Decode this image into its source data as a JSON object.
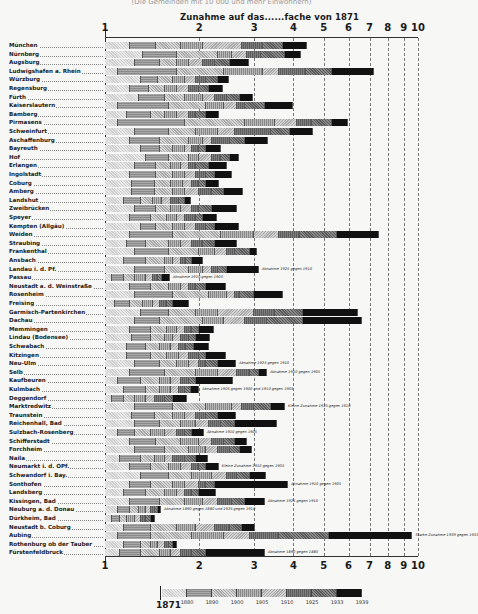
{
  "chart_data": {
    "type": "bar",
    "orientation": "horizontal",
    "stacked": true,
    "scale": "log",
    "title": "Zunahme auf das......fache von 1871",
    "xlabel": "Zunahme auf das......fache von 1871",
    "ylabel": "",
    "xlim": [
      1,
      10
    ],
    "x_ticks": [
      1,
      2,
      3,
      4,
      5,
      6,
      7,
      8,
      9,
      10
    ],
    "grid": true,
    "legend_position": "bottom",
    "legend": {
      "base_label": "1871",
      "entries": [
        "1880",
        "1890",
        "1900",
        "1905",
        "1910",
        "1925",
        "1933",
        "1939"
      ]
    },
    "categories": [
      "München",
      "Nürnberg",
      "Augsburg",
      "Ludwigshafen a. Rhein",
      "Würzburg",
      "Regensburg",
      "Fürth",
      "Kaiserslautern",
      "Bamberg",
      "Pirmasens",
      "Schweinfurt",
      "Aschaffenburg",
      "Bayreuth",
      "Hof",
      "Erlangen",
      "Ingolstadt",
      "Coburg",
      "Amberg",
      "Landshut",
      "Zweibrücken",
      "Speyer",
      "Kempten (Allgäu)",
      "Weiden",
      "Straubing",
      "Frankenthal",
      "Ansbach",
      "Landau i. d. Pf.",
      "Passau",
      "Neustadt a. d. Weinstraße",
      "Rosenheim",
      "Freising",
      "Garmisch-Partenkirchen",
      "Dachau",
      "Memmingen",
      "Lindau (Bodensee)",
      "Schwabach",
      "Kitzingen",
      "Neu-Ulm",
      "Selb",
      "Kaufbeuren",
      "Kulmbach",
      "Deggendorf",
      "Marktredwitz",
      "Traunstein",
      "Reichenhall, Bad",
      "Sulzbach-Rosenberg",
      "Schifferstadt",
      "Forchheim",
      "Naila",
      "Neumarkt i. d. OPf.",
      "Schwandorf i. Bay.",
      "Sonthofen",
      "Landsberg",
      "Kissingen, Bad",
      "Neuburg a. d. Donau",
      "Dürkheim, Bad",
      "Neustadt b. Coburg",
      "Aubing",
      "Rothenburg ob der Tauber",
      "Fürstenfeldbruck"
    ],
    "series_note": "Each bar = growth factor vs 1871 at census years 1880, 1890, 1900, 1905, 1910, 1925, 1933, 1939 (cumulative). Values estimated from pixels.",
    "values_1939": [
      4.42,
      4.23,
      2.88,
      7.25,
      2.49,
      2.38,
      2.97,
      3.99,
      2.31,
      5.97,
      4.62,
      3.32,
      2.34,
      2.68,
      2.45,
      2.55,
      2.31,
      2.76,
      1.89,
      2.64,
      2.28,
      2.68,
      7.49,
      2.64,
      3.06,
      2.05,
      3.1,
      1.61,
      2.43,
      3.7,
      1.86,
      6.43,
      6.63,
      2.23,
      2.17,
      2.15,
      2.43,
      2.62,
      3.29,
      2.56,
      2.0,
      1.83,
      3.76,
      2.62,
      3.54,
      2.07,
      2.85,
      2.95,
      2.14,
      2.31,
      3.27,
      3.84,
      2.26,
      3.24,
      1.51,
      1.45,
      3.01,
      9.6,
      1.7,
      3.24
    ],
    "breakpoints": [
      [
        1.2,
        1.45,
        1.75,
        2.05,
        2.75,
        3.2,
        3.7,
        4.42
      ],
      [
        1.32,
        1.7,
        2.3,
        2.55,
        2.85,
        3.15,
        3.75,
        4.23
      ],
      [
        1.25,
        1.5,
        1.7,
        1.85,
        2.05,
        2.25,
        2.5,
        2.88
      ],
      [
        1.1,
        1.7,
        2.4,
        3.2,
        3.6,
        4.4,
        5.3,
        7.25
      ],
      [
        1.3,
        1.48,
        1.65,
        1.8,
        1.95,
        2.1,
        2.3,
        2.49
      ],
      [
        1.2,
        1.38,
        1.55,
        1.7,
        1.85,
        2.0,
        2.15,
        2.38
      ],
      [
        1.28,
        1.55,
        1.8,
        2.05,
        2.25,
        2.45,
        2.7,
        2.97
      ],
      [
        1.1,
        1.6,
        2.1,
        2.4,
        2.65,
        2.8,
        3.25,
        3.99
      ],
      [
        1.18,
        1.4,
        1.55,
        1.7,
        1.85,
        1.95,
        2.1,
        2.31
      ],
      [
        1.1,
        1.8,
        2.8,
        3.5,
        4.1,
        4.6,
        5.3,
        5.97
      ],
      [
        1.25,
        1.6,
        1.95,
        2.3,
        2.6,
        3.4,
        3.9,
        4.62
      ],
      [
        1.2,
        1.5,
        1.85,
        2.05,
        2.2,
        2.5,
        2.8,
        3.32
      ],
      [
        1.3,
        1.5,
        1.65,
        1.8,
        1.9,
        2.0,
        2.1,
        2.34
      ],
      [
        1.35,
        1.6,
        1.85,
        2.0,
        2.2,
        2.35,
        2.5,
        2.68
      ],
      [
        1.25,
        1.45,
        1.62,
        1.75,
        1.85,
        1.95,
        2.15,
        2.45
      ],
      [
        1.2,
        1.45,
        1.65,
        1.8,
        1.95,
        2.1,
        2.25,
        2.55
      ],
      [
        1.22,
        1.45,
        1.62,
        1.78,
        1.9,
        2.0,
        2.1,
        2.31
      ],
      [
        1.22,
        1.45,
        1.65,
        1.8,
        2.0,
        2.2,
        2.4,
        2.76
      ],
      [
        1.15,
        1.3,
        1.42,
        1.52,
        1.62,
        1.72,
        1.8,
        1.89
      ],
      [
        1.25,
        1.45,
        1.62,
        1.75,
        1.9,
        2.0,
        2.2,
        2.64
      ],
      [
        1.2,
        1.4,
        1.58,
        1.7,
        1.8,
        1.95,
        2.05,
        2.28
      ],
      [
        1.3,
        1.45,
        1.65,
        1.8,
        1.95,
        2.1,
        2.25,
        2.68
      ],
      [
        1.2,
        1.65,
        2.35,
        3.0,
        3.6,
        4.2,
        5.5,
        7.49
      ],
      [
        1.18,
        1.35,
        1.6,
        1.75,
        1.9,
        2.05,
        2.25,
        2.64
      ],
      [
        1.25,
        1.6,
        2.0,
        2.25,
        2.45,
        2.6,
        2.9,
        3.06
      ],
      [
        1.15,
        1.35,
        1.55,
        1.65,
        1.75,
        1.82,
        1.9,
        2.05
      ],
      [
        1.25,
        1.55,
        1.85,
        2.05,
        2.2,
        2.3,
        2.45,
        3.1
      ],
      [
        1.05,
        1.15,
        1.25,
        1.35,
        1.42,
        1.48,
        1.52,
        1.61
      ],
      [
        1.2,
        1.4,
        1.6,
        1.75,
        1.85,
        1.95,
        2.1,
        2.43
      ],
      [
        1.25,
        1.65,
        2.15,
        2.45,
        2.6,
        2.7,
        3.0,
        3.7
      ],
      [
        1.08,
        1.2,
        1.32,
        1.42,
        1.5,
        1.58,
        1.65,
        1.86
      ],
      [
        1.3,
        1.6,
        1.95,
        2.3,
        3.0,
        3.5,
        4.3,
        6.43
      ],
      [
        1.25,
        1.5,
        2.05,
        2.4,
        2.8,
        3.3,
        4.3,
        6.63
      ],
      [
        1.2,
        1.4,
        1.58,
        1.7,
        1.8,
        1.9,
        2.0,
        2.23
      ],
      [
        1.22,
        1.4,
        1.55,
        1.65,
        1.75,
        1.85,
        1.95,
        2.17
      ],
      [
        1.18,
        1.35,
        1.5,
        1.62,
        1.72,
        1.82,
        1.92,
        2.15
      ],
      [
        1.18,
        1.4,
        1.58,
        1.72,
        1.85,
        2.0,
        2.1,
        2.43
      ],
      [
        1.25,
        1.5,
        1.7,
        1.85,
        2.0,
        2.1,
        2.3,
        2.62
      ],
      [
        1.2,
        1.55,
        1.95,
        2.3,
        2.65,
        2.9,
        3.1,
        3.29
      ],
      [
        1.1,
        1.3,
        1.5,
        1.62,
        1.75,
        1.85,
        1.95,
        2.56
      ],
      [
        1.15,
        1.35,
        1.5,
        1.62,
        1.72,
        1.8,
        1.88,
        2.0
      ],
      [
        1.05,
        1.15,
        1.25,
        1.35,
        1.45,
        1.55,
        1.65,
        1.83
      ],
      [
        1.25,
        1.65,
        2.1,
        2.55,
        2.75,
        3.0,
        3.4,
        3.76
      ],
      [
        1.22,
        1.45,
        1.65,
        1.8,
        1.95,
        2.1,
        2.3,
        2.62
      ],
      [
        1.25,
        1.5,
        1.75,
        1.95,
        2.15,
        2.35,
        2.6,
        3.54
      ],
      [
        1.1,
        1.25,
        1.4,
        1.55,
        1.7,
        1.8,
        1.9,
        2.07
      ],
      [
        1.2,
        1.45,
        1.75,
        2.0,
        2.2,
        2.4,
        2.6,
        2.85
      ],
      [
        1.25,
        1.55,
        1.85,
        2.1,
        2.3,
        2.5,
        2.7,
        2.95
      ],
      [
        1.12,
        1.3,
        1.45,
        1.55,
        1.65,
        1.8,
        1.95,
        2.14
      ],
      [
        1.2,
        1.4,
        1.6,
        1.75,
        1.9,
        2.0,
        2.1,
        2.31
      ],
      [
        1.3,
        1.6,
        1.9,
        2.2,
        2.45,
        2.65,
        2.9,
        3.27
      ],
      [
        1.2,
        1.4,
        1.65,
        1.8,
        2.0,
        2.1,
        2.25,
        3.84
      ],
      [
        1.15,
        1.35,
        1.55,
        1.7,
        1.8,
        1.9,
        2.0,
        2.26
      ],
      [
        1.2,
        1.5,
        1.8,
        2.05,
        2.3,
        2.55,
        2.8,
        3.24
      ],
      [
        1.1,
        1.2,
        1.28,
        1.35,
        1.4,
        1.44,
        1.48,
        1.51
      ],
      [
        1.05,
        1.12,
        1.18,
        1.25,
        1.3,
        1.35,
        1.4,
        1.45
      ],
      [
        1.15,
        1.4,
        1.7,
        1.95,
        2.25,
        2.5,
        2.75,
        3.01
      ],
      [
        1.1,
        1.4,
        1.9,
        2.4,
        2.9,
        3.6,
        5.2,
        9.6
      ],
      [
        1.15,
        1.3,
        1.4,
        1.48,
        1.55,
        1.6,
        1.65,
        1.7
      ],
      [
        1.12,
        1.3,
        1.5,
        1.62,
        1.75,
        1.9,
        2.1,
        3.24
      ]
    ],
    "annotations": [
      {
        "row": "Landau i. d. Pf.",
        "text": "Abnahme 1925 gegen 1910"
      },
      {
        "row": "Passau",
        "text": "Abnahme 1910 gegen 1905"
      },
      {
        "row": "Neu-Ulm",
        "text": "Abnahme 1925 gegen 1910"
      },
      {
        "row": "Selb",
        "text": "Abnahme 1910 gegen 1905"
      },
      {
        "row": "Kulmbach",
        "text": "Abnahme 1905 gegen 1900 und 1910 gegen 1905"
      },
      {
        "row": "Marktredwitz",
        "text": "Kleine Zunahme 1925 gegen 1910"
      },
      {
        "row": "Sulzbach-Rosenberg",
        "text": "Abnahme 1910 gegen 1905"
      },
      {
        "row": "Neumarkt i. d. OPf.",
        "text": "Kleine Zunahme 1910 gegen 1905"
      },
      {
        "row": "Sonthofen",
        "text": "Abnahme 1910 gegen 1905"
      },
      {
        "row": "Kissingen, Bad",
        "text": "Abnahme 1925 gegen 1910"
      },
      {
        "row": "Neuburg a. d. Donau",
        "text": "Abnahme 1890 gegen 1880 und 1925 gegen 1910"
      },
      {
        "row": "Aubing",
        "text": "Starke Zunahme 1939 gegen 1933"
      },
      {
        "row": "Fürstenfeldbruck",
        "text": "Abnahme 1890 gegen 1880"
      }
    ]
  },
  "header": {
    "top_title": "(Die Gemeinden mit 10 000 und mehr Einwohnern)",
    "axis_title": "Zunahme auf das......fache von 1871"
  },
  "ticks": [
    "1",
    "2",
    "3",
    "4",
    "5",
    "6",
    "7",
    "8",
    "9",
    "10"
  ],
  "legend": {
    "base": "1871",
    "years": [
      "1880",
      "1890",
      "1900",
      "1905",
      "1910",
      "1925",
      "1933",
      "1939"
    ]
  }
}
